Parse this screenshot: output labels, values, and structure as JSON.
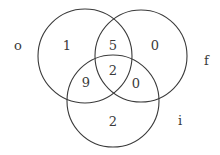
{
  "diagram": {
    "type": "venn3",
    "sets": [
      {
        "label": "o",
        "cx": 85,
        "cy": 56,
        "r": 47,
        "label_x": 14,
        "label_y": 50
      },
      {
        "label": "f",
        "cx": 141,
        "cy": 56,
        "r": 46,
        "label_x": 204,
        "label_y": 65
      },
      {
        "label": "i",
        "cx": 113,
        "cy": 101,
        "r": 46,
        "label_x": 178,
        "label_y": 125
      }
    ],
    "regions": [
      {
        "id": "o_only",
        "value": "1",
        "x": 67,
        "y": 50
      },
      {
        "id": "o_f",
        "value": "5",
        "x": 113,
        "y": 50
      },
      {
        "id": "f_only",
        "value": "0",
        "x": 155,
        "y": 50
      },
      {
        "id": "o_f_i",
        "value": "2",
        "x": 113,
        "y": 75
      },
      {
        "id": "o_i",
        "value": "9",
        "x": 86,
        "y": 87
      },
      {
        "id": "f_i",
        "value": "0",
        "x": 136,
        "y": 88
      },
      {
        "id": "i_only",
        "value": "2",
        "x": 113,
        "y": 126
      }
    ],
    "stroke_color": "#3a3a3a",
    "text_color": "#3a3a3a"
  }
}
